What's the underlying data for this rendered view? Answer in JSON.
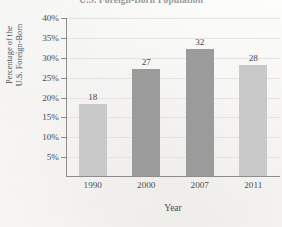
{
  "chart_data": {
    "type": "bar",
    "title": "U.S. Foreign-Born Population",
    "xlabel": "Year",
    "ylabel": "Percentage of the U.S. Foreign-Born",
    "ylabel_lines": [
      "Percentage of the",
      "U.S. Foreign-Born"
    ],
    "categories": [
      "1990",
      "2000",
      "2007",
      "2011"
    ],
    "values": [
      18,
      27,
      32,
      28
    ],
    "value_labels": [
      "18",
      "27",
      "32",
      "28"
    ],
    "bar_colors": [
      "#c9c9c9",
      "#9b9b9b",
      "#9b9b9b",
      "#c9c9c9"
    ],
    "ylim": [
      0,
      40
    ],
    "y_ticks": [
      5,
      10,
      15,
      20,
      25,
      30,
      35,
      40
    ],
    "y_tick_labels": [
      "5%",
      "10%",
      "15%",
      "20%",
      "25%",
      "30%",
      "35%",
      "40%"
    ],
    "grid": true,
    "legend": null,
    "axis_color": "#8d8d8d",
    "gridline_color": "#e3e3e1"
  }
}
